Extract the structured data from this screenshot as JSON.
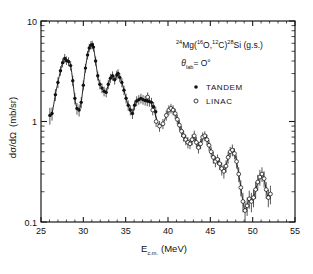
{
  "figure": {
    "reaction_pre": "Mg(",
    "reaction_mass1": "24",
    "reaction_mass2": "16",
    "reaction_o": "O,",
    "reaction_mass3": "12",
    "reaction_c": "C)",
    "reaction_mass4": "28",
    "reaction_post": "Si (g.s.)",
    "angle_theta": "θ",
    "angle_sub": "lab",
    "angle_value": "= O°",
    "curve_color": "#1a1a1a",
    "marker_color": "#111111",
    "axis_color": "#1a1a1a"
  },
  "legend": {
    "position": "top-right-inside",
    "entries": [
      {
        "label": "TANDEM",
        "marker": "filled-circle"
      },
      {
        "label": "LINAC",
        "marker": "open-circle"
      }
    ]
  },
  "chart_data": {
    "type": "scatter",
    "title": "",
    "xlabel_main": "E",
    "xlabel_sub": "c.m.",
    "xlabel_unit": "(MeV)",
    "ylabel_main": "dσ/dΩ",
    "ylabel_unit": "(mb/sr)",
    "xlim": [
      25,
      55
    ],
    "ylim": [
      0.1,
      10
    ],
    "yscale": "log",
    "xscale": "linear",
    "grid": false,
    "xticks": [
      25,
      30,
      35,
      40,
      45,
      50,
      55
    ],
    "xticklabels": [
      "25",
      "30",
      "35",
      "40",
      "45",
      "50",
      "55"
    ],
    "yticks": [
      0.1,
      1,
      10
    ],
    "yticklabels": [
      "0.1",
      "1",
      "10"
    ],
    "yminorticks": [
      0.2,
      0.3,
      0.4,
      0.5,
      0.6,
      0.7,
      0.8,
      0.9,
      2,
      3,
      4,
      5,
      6,
      7,
      8,
      9
    ],
    "series": [
      {
        "name": "TANDEM",
        "marker": "filled-circle",
        "x": [
          26.05,
          26.3,
          26.7,
          27.0,
          27.3,
          27.55,
          27.8,
          28.0,
          28.25,
          28.5,
          28.75,
          29.0,
          29.25,
          29.5,
          29.75,
          30.0,
          30.25,
          30.5,
          30.7,
          30.9,
          31.05,
          31.2,
          31.45,
          31.7,
          31.95,
          32.2,
          32.45,
          32.7,
          32.95,
          33.2,
          33.45,
          33.7,
          33.95,
          34.1,
          34.3,
          34.55,
          34.8,
          35.05,
          35.3,
          35.55,
          35.8,
          36.05,
          36.3,
          36.55,
          36.8,
          37.05,
          37.3,
          37.55,
          37.8,
          38.05,
          38.3,
          38.55
        ],
        "y": [
          1.15,
          1.2,
          1.85,
          2.45,
          3.2,
          3.85,
          4.25,
          4.05,
          3.95,
          3.6,
          2.55,
          1.7,
          1.35,
          1.3,
          1.55,
          2.3,
          3.4,
          4.6,
          5.4,
          5.75,
          5.8,
          5.5,
          4.0,
          2.85,
          2.35,
          2.15,
          2.0,
          1.95,
          2.35,
          2.7,
          2.85,
          2.6,
          2.9,
          3.0,
          2.75,
          2.45,
          2.05,
          1.7,
          1.45,
          1.3,
          1.2,
          1.45,
          1.6,
          1.65,
          1.7,
          1.65,
          1.62,
          1.6,
          1.58,
          1.55,
          1.4,
          1.25
        ],
        "yerr": [
          0.22,
          0.18,
          0.25,
          0.3,
          0.35,
          0.4,
          0.45,
          0.4,
          0.4,
          0.38,
          0.3,
          0.22,
          0.18,
          0.18,
          0.2,
          0.26,
          0.34,
          0.45,
          0.52,
          0.55,
          0.55,
          0.52,
          0.42,
          0.3,
          0.26,
          0.24,
          0.22,
          0.21,
          0.25,
          0.28,
          0.3,
          0.27,
          0.3,
          0.31,
          0.29,
          0.26,
          0.22,
          0.19,
          0.17,
          0.15,
          0.14,
          0.16,
          0.18,
          0.18,
          0.19,
          0.18,
          0.18,
          0.18,
          0.18,
          0.17,
          0.16,
          0.15
        ]
      },
      {
        "name": "LINAC",
        "marker": "open-circle",
        "x": [
          37.6,
          38.2,
          38.6,
          39.0,
          39.4,
          39.8,
          40.1,
          40.35,
          40.6,
          40.85,
          41.1,
          41.35,
          41.6,
          41.85,
          42.1,
          42.35,
          42.6,
          42.85,
          43.1,
          43.35,
          43.6,
          43.85,
          44.1,
          44.35,
          44.6,
          44.85,
          45.1,
          45.35,
          45.6,
          45.85,
          46.1,
          46.35,
          46.6,
          46.85,
          47.1,
          47.35,
          47.6,
          47.85,
          48.1,
          48.35,
          48.6,
          48.85,
          49.1,
          49.35,
          49.6,
          49.85,
          50.1,
          50.35,
          50.6,
          50.85,
          51.1,
          51.35,
          51.6,
          51.85,
          52.1
        ],
        "y": [
          1.75,
          1.3,
          1.0,
          0.9,
          0.95,
          1.15,
          1.3,
          1.35,
          1.3,
          1.2,
          1.05,
          0.92,
          0.8,
          0.72,
          0.66,
          0.62,
          0.6,
          0.66,
          0.72,
          0.62,
          0.55,
          0.6,
          0.7,
          0.72,
          0.66,
          0.58,
          0.5,
          0.44,
          0.4,
          0.42,
          0.38,
          0.34,
          0.32,
          0.36,
          0.44,
          0.5,
          0.52,
          0.48,
          0.4,
          0.3,
          0.22,
          0.16,
          0.13,
          0.145,
          0.17,
          0.16,
          0.175,
          0.21,
          0.25,
          0.28,
          0.3,
          0.27,
          0.21,
          0.175,
          0.19
        ],
        "yerr": [
          0.2,
          0.15,
          0.12,
          0.11,
          0.11,
          0.13,
          0.15,
          0.15,
          0.15,
          0.14,
          0.12,
          0.11,
          0.1,
          0.09,
          0.08,
          0.08,
          0.07,
          0.08,
          0.09,
          0.08,
          0.07,
          0.07,
          0.08,
          0.08,
          0.08,
          0.07,
          0.06,
          0.06,
          0.05,
          0.05,
          0.05,
          0.05,
          0.05,
          0.05,
          0.06,
          0.06,
          0.07,
          0.06,
          0.06,
          0.05,
          0.04,
          0.035,
          0.03,
          0.03,
          0.035,
          0.035,
          0.035,
          0.04,
          0.045,
          0.05,
          0.05,
          0.05,
          0.04,
          0.035,
          0.04
        ]
      }
    ]
  }
}
